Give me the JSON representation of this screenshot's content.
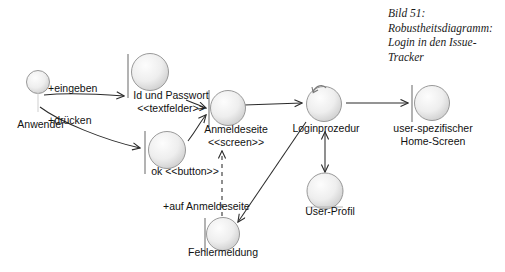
{
  "figure": {
    "caption": "Bild 51:\nRobustheitsdiagramm:\nLogin in den Issue-\nTracker",
    "type": "uml-robustness-diagram"
  },
  "diagram": {
    "nodes": [
      {
        "id": "anwender",
        "label": "Anwender",
        "stereotype": "actor",
        "icon": "actor-icon"
      },
      {
        "id": "idpass",
        "label": "Id  und Passwort\n<<textfelder>>",
        "stereotype": "boundary",
        "icon": "boundary-icon"
      },
      {
        "id": "okbutton",
        "label": "ok <<button>>",
        "stereotype": "boundary",
        "icon": "boundary-icon"
      },
      {
        "id": "anmeldeseite",
        "label": "Anmeldeseite\n<<screen>>",
        "stereotype": "boundary",
        "icon": "boundary-icon"
      },
      {
        "id": "loginprozedur",
        "label": "Loginprozedur",
        "stereotype": "control",
        "icon": "control-icon"
      },
      {
        "id": "homescreen",
        "label": "user-spezifischer\nHome-Screen",
        "stereotype": "boundary",
        "icon": "boundary-icon"
      },
      {
        "id": "userprofil",
        "label": "User-Profil",
        "stereotype": "entity",
        "icon": "entity-icon"
      },
      {
        "id": "fehlermeldung",
        "label": "Fehlermeldung",
        "stereotype": "boundary",
        "icon": "boundary-icon"
      }
    ],
    "edges": [
      {
        "id": "e1",
        "from": "anwender",
        "to": "idpass",
        "label": "+eingeben",
        "style": "solid",
        "arrow": "single"
      },
      {
        "id": "e2",
        "from": "anwender",
        "to": "okbutton",
        "label": "+drücken",
        "style": "solid",
        "arrow": "single"
      },
      {
        "id": "e3",
        "from": "idpass",
        "to": "anmeldeseite",
        "label": "",
        "style": "solid",
        "arrow": "single"
      },
      {
        "id": "e4",
        "from": "okbutton",
        "to": "anmeldeseite",
        "label": "",
        "style": "solid",
        "arrow": "single"
      },
      {
        "id": "e5",
        "from": "anmeldeseite",
        "to": "loginprozedur",
        "label": "",
        "style": "solid",
        "arrow": "single"
      },
      {
        "id": "e6",
        "from": "loginprozedur",
        "to": "homescreen",
        "label": "",
        "style": "solid",
        "arrow": "single"
      },
      {
        "id": "e7",
        "from": "loginprozedur",
        "to": "userprofil",
        "label": "",
        "style": "solid",
        "arrow": "double"
      },
      {
        "id": "e8",
        "from": "loginprozedur",
        "to": "fehlermeldung",
        "label": "",
        "style": "solid",
        "arrow": "single"
      },
      {
        "id": "e9",
        "from": "fehlermeldung",
        "to": "anmeldeseite",
        "label": "+auf Anmeldeseite",
        "style": "dashed",
        "arrow": "single"
      }
    ]
  },
  "colors": {
    "stroke": "#2b2b2b",
    "node_fill_light": "#f4f4f4",
    "node_fill_dark": "#cfcfcf",
    "text": "#111111",
    "background": "#ffffff"
  }
}
